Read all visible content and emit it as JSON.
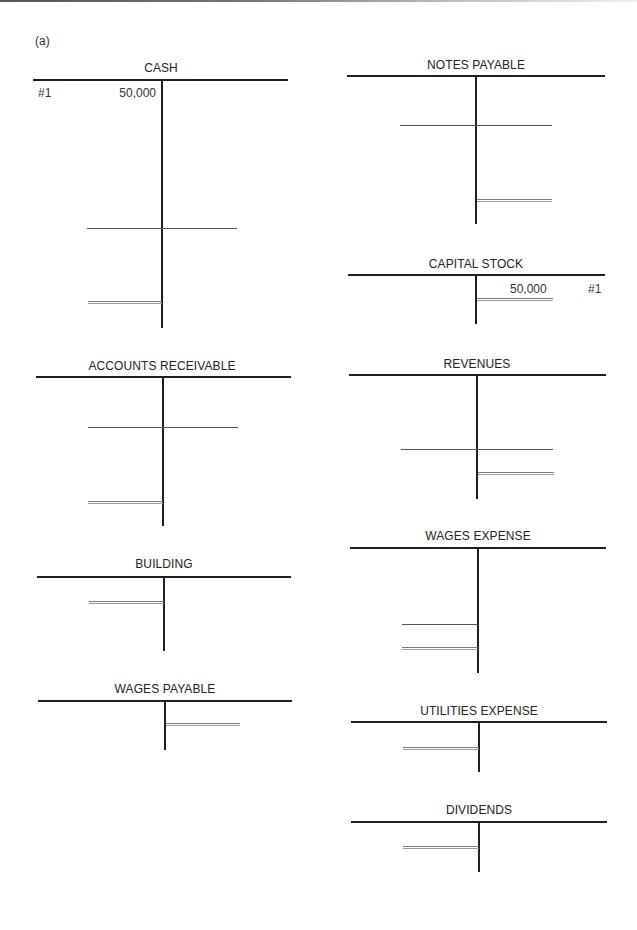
{
  "page": {
    "part_label": "(a)"
  },
  "accounts": {
    "cash": {
      "title": "CASH",
      "debits": [
        {
          "ref": "#1",
          "amount": "50,000"
        }
      ],
      "credits": []
    },
    "notes_payable": {
      "title": "NOTES PAYABLE",
      "debits": [],
      "credits": []
    },
    "capital_stock": {
      "title": "CAPITAL STOCK",
      "debits": [],
      "credits": [
        {
          "ref": "#1",
          "amount": "50,000"
        }
      ]
    },
    "accounts_receivable": {
      "title": "ACCOUNTS RECEIVABLE",
      "debits": [],
      "credits": []
    },
    "revenues": {
      "title": "REVENUES",
      "debits": [],
      "credits": []
    },
    "building": {
      "title": "BUILDING",
      "debits": [],
      "credits": []
    },
    "wages_expense": {
      "title": "WAGES EXPENSE",
      "debits": [],
      "credits": []
    },
    "wages_payable": {
      "title": "WAGES PAYABLE",
      "debits": [],
      "credits": []
    },
    "utilities_expense": {
      "title": "UTILITIES EXPENSE",
      "debits": [],
      "credits": []
    },
    "dividends": {
      "title": "DIVIDENDS",
      "debits": [],
      "credits": []
    }
  }
}
